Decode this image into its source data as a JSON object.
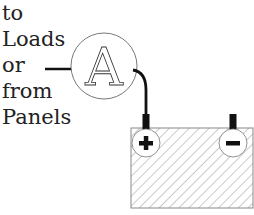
{
  "diagram": {
    "label_lines": [
      "to",
      "Loads",
      "or",
      "from",
      "Panels"
    ],
    "meter": {
      "symbol": "A",
      "name": "ammeter"
    },
    "battery": {
      "positive_symbol": "+",
      "negative_symbol": "−"
    }
  }
}
